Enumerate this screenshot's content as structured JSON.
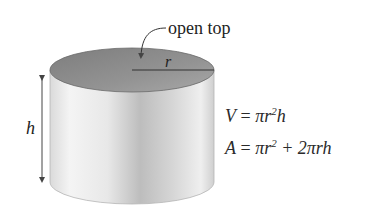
{
  "diagram": {
    "annotations": {
      "top_label": "open top",
      "radius_label": "r",
      "height_label": "h"
    },
    "formulas": {
      "volume": {
        "lhs": "V",
        "eq": "=",
        "rhs_pre": "πr",
        "rhs_exp": "2",
        "rhs_post": "h"
      },
      "area": {
        "lhs": "A",
        "eq": "=",
        "rhs_pre": "πr",
        "rhs_exp": "2",
        "rhs_post": "+ 2πrh"
      }
    },
    "colors": {
      "top_fill": "#8f8f8f",
      "body_light": "#f2f2f2",
      "body_mid": "#c4c4c4",
      "body_dark": "#9a9a9a",
      "line": "#444444"
    }
  }
}
